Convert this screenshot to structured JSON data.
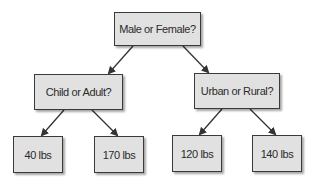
{
  "diagram": {
    "type": "decision-tree",
    "root": {
      "label": "Male or Female?"
    },
    "branches": [
      {
        "label": "Child or Adult?",
        "leaves": [
          "40 lbs",
          "170 lbs"
        ]
      },
      {
        "label": "Urban or Rural?",
        "leaves": [
          "120 lbs",
          "140 lbs"
        ]
      }
    ],
    "edges": [
      {
        "from": "Male or Female?",
        "to": "Child or Adult?"
      },
      {
        "from": "Male or Female?",
        "to": "Urban or Rural?"
      },
      {
        "from": "Child or Adult?",
        "to": "40 lbs"
      },
      {
        "from": "Child or Adult?",
        "to": "170 lbs"
      },
      {
        "from": "Urban or Rural?",
        "to": "120 lbs"
      },
      {
        "from": "Urban or Rural?",
        "to": "140 lbs"
      }
    ],
    "colors": {
      "node_fill": "#e1e1e1",
      "node_border": "#3a3a3a",
      "edge": "#333333",
      "text": "#2b2b2b"
    }
  }
}
